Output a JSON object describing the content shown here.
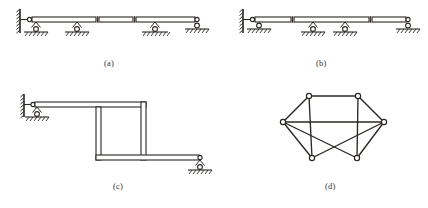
{
  "figure": {
    "background_color": "#ffffff",
    "line_color": "#2b2724",
    "node_fill": "#ffffff",
    "panels": [
      {
        "id": "a",
        "caption": "(a)",
        "type": "continuous-beam-with-internal-hinges",
        "description": "Horizontal double-line beam fixed to a hatched vertical wall at the left, resting on four roller supports with ground hatching; two internal hinges break the beam into three segments.",
        "beam": {
          "x_start": 27,
          "x_end": 199,
          "y_top": 17,
          "y_bottom": 22
        },
        "wall": {
          "x": 20,
          "y_top": 10,
          "y_bottom": 32,
          "hatch_count": 7
        },
        "supports": [
          {
            "kind": "roller",
            "x": 36,
            "y": 24,
            "ground_y": 36,
            "ground_half_width": 12
          },
          {
            "kind": "roller",
            "x": 77,
            "y": 24,
            "ground_y": 36,
            "ground_half_width": 12
          },
          {
            "kind": "roller",
            "x": 155,
            "y": 24,
            "ground_y": 36,
            "ground_half_width": 13
          },
          {
            "kind": "roller",
            "x": 197,
            "y": 24,
            "ground_y": 36,
            "ground_half_width": 12
          }
        ],
        "hinges": [
          {
            "x": 97
          },
          {
            "x": 134
          }
        ]
      },
      {
        "id": "b",
        "caption": "(b)",
        "type": "continuous-beam-with-internal-hinges",
        "description": "Horizontal double-line beam fixed to a hatched vertical wall at the left, resting on four roller supports; two internal hinges break the beam into three segments with a different spacing than panel (a).",
        "beam": {
          "x_start": 250,
          "x_end": 412,
          "y_top": 17,
          "y_bottom": 22
        },
        "wall": {
          "x": 243,
          "y_top": 10,
          "y_bottom": 32,
          "hatch_count": 7
        },
        "supports": [
          {
            "kind": "roller",
            "x": 259,
            "y": 24,
            "ground_y": 36,
            "ground_half_width": 12
          },
          {
            "kind": "roller",
            "x": 313,
            "y": 24,
            "ground_y": 36,
            "ground_half_width": 12
          },
          {
            "kind": "roller",
            "x": 345,
            "y": 24,
            "ground_y": 36,
            "ground_half_width": 12
          },
          {
            "kind": "roller",
            "x": 408,
            "y": 24,
            "ground_y": 36,
            "ground_half_width": 12
          }
        ],
        "hinges": [
          {
            "x": 292
          },
          {
            "x": 370
          }
        ]
      },
      {
        "id": "c",
        "caption": "(c)",
        "type": "stepped-frame",
        "description": "Stepped rigid frame of double-line members: upper horizontal member fixed to a hatched wall at the left and supported by a roller, descending through two vertical members to a lower horizontal member ending at a roller support on the right.",
        "wall": {
          "x": 22,
          "y_top": 96,
          "y_bottom": 118,
          "hatch_count": 6
        },
        "supports": [
          {
            "kind": "roller",
            "x": 37,
            "y": 110,
            "ground_y": 122,
            "ground_half_width": 12
          },
          {
            "kind": "roller",
            "x": 200,
            "y": 160,
            "ground_y": 172,
            "ground_half_width": 12
          }
        ],
        "members": [
          {
            "kind": "horizontal",
            "x1": 30,
            "x2": 146,
            "y_top": 102,
            "y_bottom": 107
          },
          {
            "kind": "vertical",
            "x_left": 141,
            "x_right": 146,
            "y1": 102,
            "y2": 155
          },
          {
            "kind": "vertical",
            "x_left": 96,
            "x_right": 101,
            "y1": 107,
            "y2": 160
          },
          {
            "kind": "horizontal",
            "x1": 96,
            "x2": 199,
            "y_top": 155,
            "y_bottom": 160
          }
        ]
      },
      {
        "id": "d",
        "caption": "(d)",
        "type": "pin-jointed-truss",
        "description": "Six-node pin-jointed truss: two top chord nodes, two side nodes, two bottom nodes, with crossing diagonal members between the bottom and side nodes.",
        "nodes": [
          {
            "name": "top-left",
            "x": 309,
            "y": 96
          },
          {
            "name": "top-right",
            "x": 358,
            "y": 96
          },
          {
            "name": "left",
            "x": 283,
            "y": 122
          },
          {
            "name": "right",
            "x": 384,
            "y": 122
          },
          {
            "name": "bottom-left",
            "x": 312,
            "y": 158
          },
          {
            "name": "bottom-right",
            "x": 357,
            "y": 158
          }
        ],
        "members": [
          {
            "from": "top-left",
            "to": "top-right"
          },
          {
            "from": "top-left",
            "to": "left"
          },
          {
            "from": "top-right",
            "to": "right"
          },
          {
            "from": "left",
            "to": "right"
          },
          {
            "from": "left",
            "to": "bottom-left"
          },
          {
            "from": "right",
            "to": "bottom-right"
          },
          {
            "from": "top-left",
            "to": "bottom-left"
          },
          {
            "from": "top-right",
            "to": "bottom-right"
          },
          {
            "from": "left",
            "to": "bottom-right"
          },
          {
            "from": "right",
            "to": "bottom-left"
          }
        ],
        "node_radius": 2.6
      }
    ]
  }
}
